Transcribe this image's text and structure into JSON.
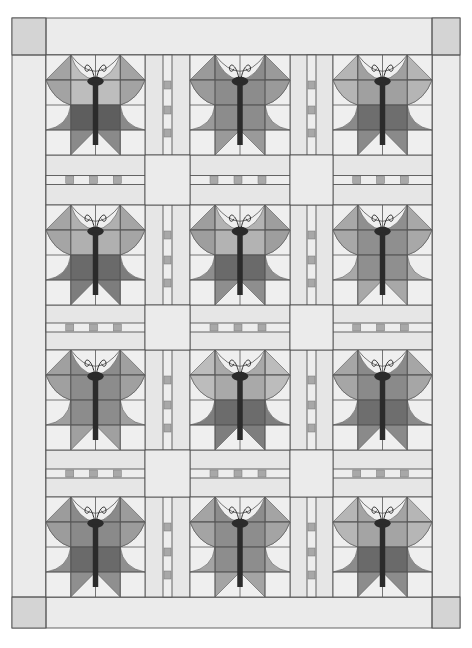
{
  "quilt": {
    "title": "Butterfly quilt layout",
    "rows": 4,
    "cols": 3,
    "colors": {
      "background": "#e8e8e8",
      "border": "#ebebeb",
      "corner": "#d4d4d4",
      "sashing": "#e6e6e6",
      "cornerstone": "#ebebeb",
      "sash_accent": "#a8a8a8",
      "line": "#555555",
      "body": "#2b2b2b",
      "block_bg": "#efefef"
    },
    "blocks": [
      {
        "name": "butterfly-r1-c1",
        "upper": "#a3a3a3",
        "upper_inner": "#bdbdbd",
        "lower": "#5e5e5e",
        "lower_outer": "#8a8a8a"
      },
      {
        "name": "butterfly-r1-c2",
        "upper": "#9a9a9a",
        "upper_inner": "#8c8c8c",
        "lower": "#8c8c8c",
        "lower_outer": "#9a9a9a"
      },
      {
        "name": "butterfly-r1-c3",
        "upper": "#b5b5b5",
        "upper_inner": "#a0a0a0",
        "lower": "#6e6e6e",
        "lower_outer": "#8a8a8a"
      },
      {
        "name": "butterfly-r2-c1",
        "upper": "#a5a5a5",
        "upper_inner": "#b0b0b0",
        "lower": "#6a6a6a",
        "lower_outer": "#7d7d7d"
      },
      {
        "name": "butterfly-r2-c2",
        "upper": "#9e9e9e",
        "upper_inner": "#b3b3b3",
        "lower": "#6a6a6a",
        "lower_outer": "#8e8e8e"
      },
      {
        "name": "butterfly-r2-c3",
        "upper": "#a8a8a8",
        "upper_inner": "#8f8f8f",
        "lower": "#8f8f8f",
        "lower_outer": "#a8a8a8"
      },
      {
        "name": "butterfly-r3-c1",
        "upper": "#a0a0a0",
        "upper_inner": "#8c8c8c",
        "lower": "#8c8c8c",
        "lower_outer": "#a0a0a0"
      },
      {
        "name": "butterfly-r3-c2",
        "upper": "#bcbcbc",
        "upper_inner": "#a9a9a9",
        "lower": "#6c6c6c",
        "lower_outer": "#7e7e7e"
      },
      {
        "name": "butterfly-r3-c3",
        "upper": "#a6a6a6",
        "upper_inner": "#8a8a8a",
        "lower": "#6e6e6e",
        "lower_outer": "#8a8a8a"
      },
      {
        "name": "butterfly-r4-c1",
        "upper": "#9c9c9c",
        "upper_inner": "#8a8a8a",
        "lower": "#6a6a6a",
        "lower_outer": "#8f8f8f"
      },
      {
        "name": "butterfly-r4-c2",
        "upper": "#a4a4a4",
        "upper_inner": "#8d8d8d",
        "lower": "#8d8d8d",
        "lower_outer": "#a4a4a4"
      },
      {
        "name": "butterfly-r4-c3",
        "upper": "#b6b6b6",
        "upper_inner": "#a4a4a4",
        "lower": "#6a6a6a",
        "lower_outer": "#8c8c8c"
      }
    ]
  }
}
